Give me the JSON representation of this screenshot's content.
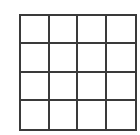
{
  "diagram": {
    "type": "grid",
    "rows": 4,
    "columns": 4,
    "line_color": "#3a3a3a",
    "background": "#ffffff",
    "cells": [
      [
        "",
        "",
        "",
        ""
      ],
      [
        "",
        "",
        "",
        ""
      ],
      [
        "",
        "",
        "",
        ""
      ],
      [
        "",
        "",
        "",
        ""
      ]
    ]
  }
}
